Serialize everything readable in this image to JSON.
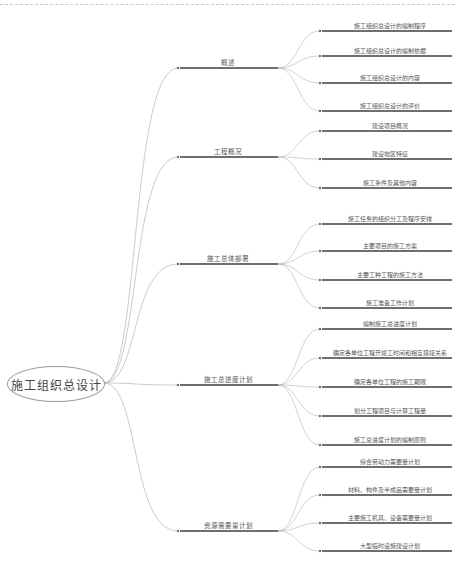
{
  "root": {
    "label": "施工组织总设计"
  },
  "colors": {
    "line": "#6e6e6e",
    "curve": "#b4b4b4",
    "text": "#555555"
  },
  "branches": [
    {
      "label": "概述",
      "y": 68,
      "children": [
        {
          "label": "施工组织总设计的编制程序",
          "y": 31
        },
        {
          "label": "施工组织总设计的编制依据",
          "y": 56
        },
        {
          "label": "施工组织总设计的内容",
          "y": 83
        },
        {
          "label": "施工组织总设计的评价",
          "y": 111
        }
      ]
    },
    {
      "label": "工程概况",
      "y": 157,
      "children": [
        {
          "label": "建设项目概况",
          "y": 131
        },
        {
          "label": "建设地区特征",
          "y": 159
        },
        {
          "label": "施工条件及其他内容",
          "y": 188
        }
      ]
    },
    {
      "label": "施工总体部署",
      "y": 264,
      "children": [
        {
          "label": "施工任务的组织分工及程序安排",
          "y": 224
        },
        {
          "label": "主要项目的施工方案",
          "y": 251
        },
        {
          "label": "主要工种工程的施工方法",
          "y": 280
        },
        {
          "label": "施工准备工作计划",
          "y": 308
        }
      ]
    },
    {
      "label": "施工总进度计划",
      "y": 385,
      "children": [
        {
          "label": "编制施工总进度计划",
          "y": 329
        },
        {
          "label": "确定各单位工程开竣工时间和相互搭接关系",
          "y": 358
        },
        {
          "label": "确定各单位工程的施工期限",
          "y": 387
        },
        {
          "label": "划分工程项目与计算工程量",
          "y": 416
        },
        {
          "label": "施工总进度计划的编制原则",
          "y": 445
        }
      ]
    },
    {
      "label": "资源需要量计划",
      "y": 531,
      "children": [
        {
          "label": "综合劳动力需要量计划",
          "y": 467
        },
        {
          "label": "材料、构件及半成品需要量计划",
          "y": 495
        },
        {
          "label": "主要施工机具、设备需要量计划",
          "y": 523
        },
        {
          "label": "大型临时设施建设计划",
          "y": 551
        }
      ]
    }
  ]
}
